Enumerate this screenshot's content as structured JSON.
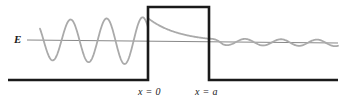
{
  "figure": {
    "energy_label": "E",
    "barrier_left_label": "x = 0",
    "barrier_right_label": "x = a",
    "colors": {
      "wavefunction": "#aaaaaa",
      "barrier": "#1a1a1a",
      "baseline": "#1a1a1a",
      "energy_line": "#888888",
      "background": "#ffffff"
    }
  },
  "chart_data": {
    "type": "line",
    "xlabel": "",
    "ylabel": "",
    "xlim": [
      0,
      341
    ],
    "ylim": [
      0,
      105
    ],
    "grid": false,
    "legend": null,
    "annotations": [
      {
        "text": "E",
        "x": 17,
        "y": 41,
        "role": "energy-level-label"
      },
      {
        "text": "x = 0",
        "x": 150,
        "y": 93,
        "role": "barrier-left-edge-label"
      },
      {
        "text": "x = a",
        "x": 207,
        "y": 93,
        "role": "barrier-right-edge-label"
      }
    ],
    "series": [
      {
        "name": "potential-barrier",
        "type": "step",
        "color": "#1a1a1a",
        "linewidth": 2.6,
        "points": [
          [
            8,
            80
          ],
          [
            148,
            80
          ],
          [
            148,
            7
          ],
          [
            209,
            7
          ],
          [
            209,
            80
          ],
          [
            338,
            80
          ]
        ]
      },
      {
        "name": "energy-level-line",
        "type": "line",
        "color": "#888888",
        "linewidth": 1,
        "points": [
          [
            27,
            40
          ],
          [
            338,
            43
          ]
        ]
      },
      {
        "name": "wavefunction",
        "type": "curve",
        "color": "#aaaaaa",
        "linewidth": 1.8,
        "description": "Incident standing wave at left, exponential decay inside barrier, small-amplitude transmitted wave at right",
        "regions": [
          {
            "name": "incident",
            "x_range": [
              40,
              148
            ],
            "amplitude": 24,
            "wavelength": 36
          },
          {
            "name": "barrier-decay",
            "x_range": [
              148,
              209
            ],
            "amplitude_start": 23,
            "amplitude_end": 3
          },
          {
            "name": "transmitted",
            "x_range": [
              209,
              338
            ],
            "amplitude": 3.2,
            "wavelength": 36
          }
        ]
      }
    ]
  }
}
